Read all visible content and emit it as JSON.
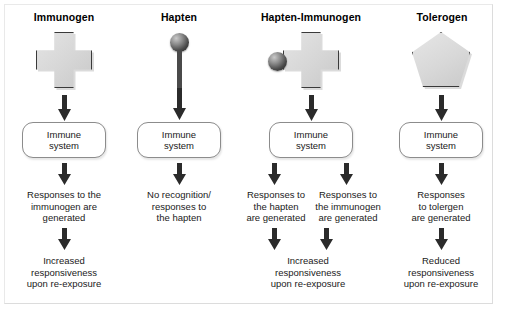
{
  "figure": {
    "columns": [
      {
        "id": "immunogen",
        "heading": "Immunogen",
        "antigen_shape": "cross",
        "immune_system_label": "Immune\nsystem",
        "immune_system_line1": "Immune",
        "immune_system_line2": "system",
        "branches": [
          {
            "response": "Responses to the\nimmunogen are\ngenerated",
            "response_line1": "Responses to the",
            "response_line2": "immunogen are",
            "response_line3": "generated"
          }
        ],
        "outcome": "Increased\nresponsiveness\nupon re-exposure",
        "outcome_line1": "Increased",
        "outcome_line2": "responsiveness",
        "outcome_line3": "upon re-exposure"
      },
      {
        "id": "hapten",
        "heading": "Hapten",
        "antigen_shape": "sphere-on-stem",
        "immune_system_line1": "Immune",
        "immune_system_line2": "system",
        "branches": [
          {
            "response_line1": "No recognition/",
            "response_line2": "responses to",
            "response_line3": "the hapten"
          }
        ],
        "outcome_line1": "",
        "outcome_line2": "",
        "outcome_line3": ""
      },
      {
        "id": "hapten-immunogen",
        "heading": "Hapten-Immunogen",
        "antigen_shape": "cross-with-sphere",
        "immune_system_line1": "Immune",
        "immune_system_line2": "system",
        "branches": [
          {
            "response_line1": "Responses to",
            "response_line2": "the hapten",
            "response_line3": "are generated"
          },
          {
            "response_line1": "Responses to",
            "response_line2": "the immunogen",
            "response_line3": "are generated"
          }
        ],
        "outcome_line1": "Increased",
        "outcome_line2": "responsiveness",
        "outcome_line3": "upon re-exposure"
      },
      {
        "id": "tolerogen",
        "heading": "Tolerogen",
        "antigen_shape": "pentagon",
        "immune_system_line1": "Immune",
        "immune_system_line2": "system",
        "branches": [
          {
            "response_line1": "Responses",
            "response_line2": "to tolergen",
            "response_line3": "are generated"
          }
        ],
        "outcome_line1": "Reduced",
        "outcome_line2": "responsiveness",
        "outcome_line3": "upon re-exposure"
      }
    ],
    "colors": {
      "shape_fill": "#d9d9d9",
      "shape_outline": "#3a3a3a",
      "arrow": "#2b2b2b",
      "box_outline": "#8c8c8c",
      "text": "#1a1a1a",
      "background": "#ffffff"
    }
  }
}
